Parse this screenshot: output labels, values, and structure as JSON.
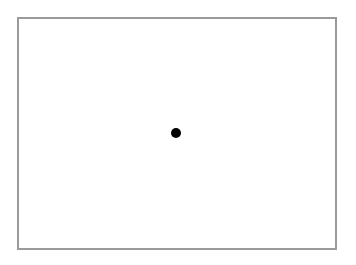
{
  "canvas": {
    "background": "#ffffff",
    "frame": {
      "border_color": "#9a9a9a",
      "fill": "#ffffff"
    },
    "dot": {
      "color": "#000000",
      "cx": 176,
      "cy": 133,
      "diameter": 10
    }
  }
}
